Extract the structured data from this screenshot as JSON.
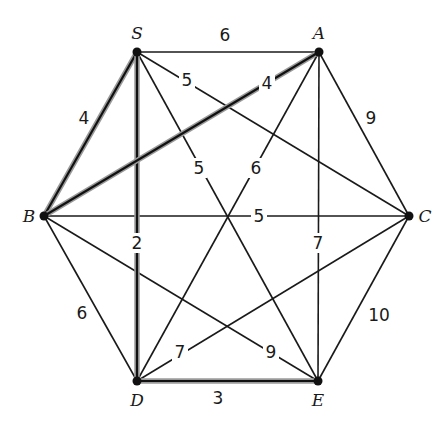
{
  "diagram": {
    "type": "weighted-graph",
    "vertices": [
      {
        "id": "S",
        "label": "S",
        "x": 137,
        "y": 52,
        "lx": 137,
        "ly": 33
      },
      {
        "id": "A",
        "label": "A",
        "x": 319,
        "y": 52,
        "lx": 319,
        "ly": 33
      },
      {
        "id": "B",
        "label": "B",
        "x": 44,
        "y": 216,
        "lx": 29,
        "ly": 216
      },
      {
        "id": "C",
        "label": "C",
        "x": 409,
        "y": 216,
        "lx": 425,
        "ly": 216
      },
      {
        "id": "D",
        "label": "D",
        "x": 137,
        "y": 381,
        "lx": 137,
        "ly": 400
      },
      {
        "id": "E",
        "label": "E",
        "x": 318,
        "y": 381,
        "lx": 318,
        "ly": 400
      }
    ],
    "edges": [
      {
        "from": "S",
        "to": "A",
        "weight": "6",
        "highlighted": false,
        "wx": 225,
        "wy": 35,
        "bg": false
      },
      {
        "from": "S",
        "to": "B",
        "weight": "4",
        "highlighted": true,
        "wx": 84,
        "wy": 118,
        "bg": false
      },
      {
        "from": "S",
        "to": "C",
        "weight": "5",
        "highlighted": false,
        "wx": 187,
        "wy": 80,
        "bg": true
      },
      {
        "from": "S",
        "to": "E",
        "weight": "5",
        "highlighted": false,
        "wx": 199,
        "wy": 168,
        "bg": true
      },
      {
        "from": "S",
        "to": "D",
        "weight": "2",
        "highlighted": true,
        "wx": 137,
        "wy": 243,
        "bg": true
      },
      {
        "from": "A",
        "to": "B",
        "weight": "4",
        "highlighted": true,
        "wx": 267,
        "wy": 83,
        "bg": true
      },
      {
        "from": "A",
        "to": "C",
        "weight": "9",
        "highlighted": false,
        "wx": 371,
        "wy": 118,
        "bg": false
      },
      {
        "from": "A",
        "to": "D",
        "weight": "6",
        "highlighted": false,
        "wx": 256,
        "wy": 168,
        "bg": true
      },
      {
        "from": "A",
        "to": "E",
        "weight": "7",
        "highlighted": false,
        "wx": 318,
        "wy": 243,
        "bg": true
      },
      {
        "from": "B",
        "to": "C",
        "weight": "5",
        "highlighted": false,
        "wx": 259,
        "wy": 216,
        "bg": true
      },
      {
        "from": "B",
        "to": "D",
        "weight": "6",
        "highlighted": false,
        "wx": 82,
        "wy": 313,
        "bg": false
      },
      {
        "from": "B",
        "to": "E",
        "weight": "9",
        "highlighted": false,
        "wx": 271,
        "wy": 352,
        "bg": true
      },
      {
        "from": "C",
        "to": "D",
        "weight": "7",
        "highlighted": false,
        "wx": 180,
        "wy": 352,
        "bg": true
      },
      {
        "from": "C",
        "to": "E",
        "weight": "10",
        "highlighted": false,
        "wx": 379,
        "wy": 315,
        "bg": false
      },
      {
        "from": "D",
        "to": "E",
        "weight": "3",
        "highlighted": true,
        "wx": 218,
        "wy": 398,
        "bg": false
      }
    ]
  },
  "colors": {
    "edge": "#1a1a1a",
    "highlight_glow": "#9a9a9a",
    "background": "#ffffff"
  }
}
